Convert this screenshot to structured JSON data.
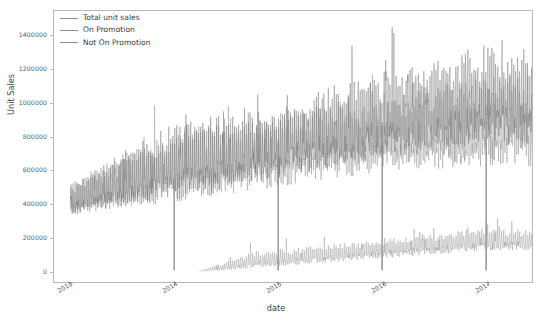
{
  "chart_data": {
    "type": "line",
    "title": "",
    "xlabel": "date",
    "ylabel": "Unit Sales",
    "grid": false,
    "legend_position": "upper left",
    "legend_frame": false,
    "xtick_labels": [
      "2013",
      "2014",
      "2015",
      "2016",
      "2017"
    ],
    "ytick_labels": [
      "0",
      "200000",
      "400000",
      "600000",
      "800000",
      "1000000",
      "1200000",
      "1400000"
    ],
    "ylim": [
      0,
      1480000
    ],
    "ytick_values": [
      0,
      200000,
      400000,
      600000,
      800000,
      1000000,
      1200000,
      1400000
    ],
    "xlim": [
      "2013-01-01",
      "2017-08-15"
    ],
    "series": [
      {
        "name": "Total unit sales",
        "color": "#7a7a7a",
        "start": "2013-01-02",
        "end": "2017-08-15",
        "description": "Daily total unit sales, strong weekly seasonality, rising trend from ~400000 in 2013 to ~900000-1400000 peaks in 2017, with near-zero drops on Jan 1 each year",
        "level_by_year": [
          400000,
          560000,
          700000,
          850000,
          950000
        ],
        "peak_by_year": [
          540000,
          960000,
          1080000,
          1250000,
          1420000
        ],
        "trough_by_year": [
          280000,
          380000,
          470000,
          560000,
          620000
        ]
      },
      {
        "name": "On Promotion",
        "color": "#a0a0a0",
        "start": "2014-04-01",
        "end": "2017-08-15",
        "description": "Daily promotional unit sales, begins April 2014 near zero, grows to ~120000-260000 by 2017",
        "level_by_year": [
          0,
          20000,
          60000,
          110000,
          170000
        ],
        "peak_by_year": [
          0,
          130000,
          150000,
          200000,
          270000
        ],
        "trough_by_year": [
          0,
          0,
          10000,
          50000,
          90000
        ]
      },
      {
        "name": "Not On Promotion",
        "color": "#989898",
        "start": "2013-01-02",
        "end": "2017-08-15",
        "description": "Daily non-promotional unit sales, tracks just beneath total unit sales",
        "level_by_year": [
          400000,
          540000,
          640000,
          740000,
          790000
        ],
        "peak_by_year": [
          540000,
          950000,
          1010000,
          1130000,
          1250000
        ],
        "trough_by_year": [
          280000,
          370000,
          430000,
          500000,
          540000
        ]
      }
    ]
  },
  "legend": {
    "items": [
      {
        "label": "Total unit sales"
      },
      {
        "label": "On Promotion"
      },
      {
        "label": "Not On Promotion"
      }
    ]
  },
  "axes": {
    "y_label": "Unit Sales",
    "x_label": "date"
  }
}
